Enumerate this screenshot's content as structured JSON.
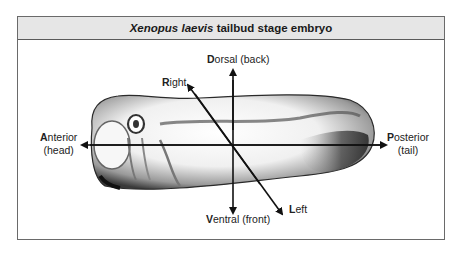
{
  "figure": {
    "title_italic": "Xenopus laevis",
    "title_rest": " tailbud stage embryo"
  },
  "axes": {
    "dorsal": {
      "initial": "D",
      "rest": "orsal (back)"
    },
    "ventral": {
      "initial": "V",
      "rest": "entral (front)"
    },
    "anterior": {
      "initial": "A",
      "rest": "nterior",
      "line2": "(head)"
    },
    "posterior": {
      "initial": "P",
      "rest": "osterior",
      "line2": "(tail)"
    },
    "right": {
      "initial": "R",
      "rest": "ight"
    },
    "left": {
      "initial": "L",
      "rest": "eft"
    }
  },
  "colors": {
    "header_bg": "#e6e6e6",
    "border": "#6a6a6a",
    "arrow": "#111111"
  }
}
